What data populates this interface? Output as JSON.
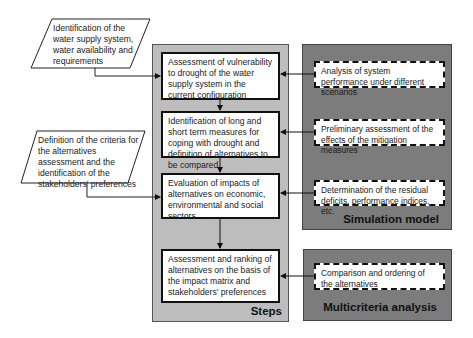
{
  "inputs": [
    {
      "text": "Identification of the water supply system, water availability and requirements"
    },
    {
      "text": "Definition of the criteria for the alternatives assessment and the identification of the stakeholders' preferences"
    }
  ],
  "steps": {
    "label": "Steps",
    "boxes": [
      {
        "text": "Assessment of vulnerability to drought of the water supply system in the current configuration"
      },
      {
        "text": "Identification of long and short term measures for coping with drought and definition of alternatives to be compared"
      },
      {
        "text": "Evaluation of impacts of alternatives on economic, environmental and social sectors"
      },
      {
        "text": "Assessment and ranking of alternatives on the basis of the impact matrix and stakeholders' preferences"
      }
    ]
  },
  "simulation_model": {
    "label": "Simulation model",
    "boxes": [
      {
        "text": "Analysis of system performance under different scenarios"
      },
      {
        "text": "Preliminary  assessment of the effects of the mitigation measures"
      },
      {
        "text": "Determination of the residual deficits, performance indices, etc."
      }
    ]
  },
  "multicriteria_analysis": {
    "label": "Multicriteria analysis",
    "boxes": [
      {
        "text": "Comparison and ordering of the alternatives"
      }
    ]
  },
  "colors": {
    "steps_panel": "#bdbdbd",
    "tool_panels": "#7c7c7c",
    "box_fill": "#ffffff",
    "lines": "#111111"
  }
}
